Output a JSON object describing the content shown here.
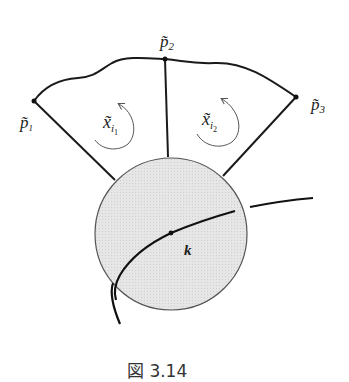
{
  "figure": {
    "caption": "図 3.14",
    "colors": {
      "stroke": "#1a1a1a",
      "disk_fill": "#e2e2e2",
      "disk_stroke": "#555555",
      "arrow": "#555555",
      "caption": "#333333"
    },
    "points": [
      {
        "id": "p1",
        "label": "p̃",
        "subscript": "1",
        "x": 34,
        "y": 101
      },
      {
        "id": "p2",
        "label": "p̃",
        "subscript": "2",
        "x": 165,
        "y": 59
      },
      {
        "id": "p3",
        "label": "p̃",
        "subscript": "3",
        "x": 296,
        "y": 97
      }
    ],
    "regions": [
      {
        "id": "xi1",
        "label": "x̃",
        "subscript": "i",
        "subsubscript": "1",
        "rotation": "counterclockwise"
      },
      {
        "id": "xi2",
        "label": "x̃",
        "subscript": "i",
        "subsubscript": "2",
        "rotation": "counterclockwise"
      }
    ],
    "disk": {
      "cx": 171,
      "cy": 234,
      "r": 76
    },
    "knot_label": "k"
  }
}
